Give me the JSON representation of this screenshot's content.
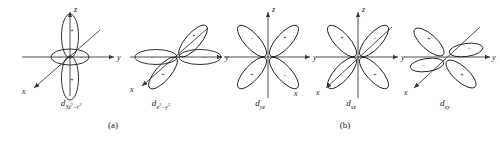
{
  "figure": {
    "background": "#ffffff",
    "stroke": "#1a1a1a",
    "axis_color": "#3a3a3a",
    "groups": [
      {
        "id": "a",
        "label": "(a)",
        "x": 113,
        "y": 124
      },
      {
        "id": "b",
        "label": "(b)",
        "x": 345,
        "y": 124
      }
    ],
    "axis_labels": {
      "x": "x",
      "y": "y",
      "z": "z"
    },
    "signs": {
      "positive": "+",
      "negative": "−"
    }
  },
  "orbitals": [
    {
      "name": "d-3z2-r2",
      "cx": 70,
      "cy": 57,
      "label_html": "d<sub>3z<sup>2</sup>−r<sup>2</sup></sub>",
      "label_text": "d3z2-r2",
      "label_x": 70,
      "label_y": 102,
      "type": "dz2",
      "lobes": [
        {
          "dir": "up",
          "sign": "+"
        },
        {
          "dir": "down",
          "sign": "+"
        },
        {
          "dir": "torus-left",
          "sign": "−"
        },
        {
          "dir": "torus-right",
          "sign": "−"
        }
      ]
    },
    {
      "name": "d-x2-y2",
      "cx": 178,
      "cy": 57,
      "label_html": "d<sub>x<sup>2</sup>−y<sup>2</sup></sub>",
      "label_text": "dx2-y2",
      "label_x": 160,
      "label_y": 102,
      "type": "dx2y2",
      "lobes": [
        {
          "dir": "+y",
          "sign": "−"
        },
        {
          "dir": "-y",
          "sign": "−"
        },
        {
          "dir": "+x",
          "sign": "+"
        },
        {
          "dir": "-x",
          "sign": "+"
        }
      ]
    },
    {
      "name": "d-yz",
      "cx": 268,
      "cy": 57,
      "label_html": "d<sub>yz</sub>",
      "label_text": "dyz",
      "label_x": 260,
      "label_y": 102,
      "type": "quad-upright",
      "lobes": [
        {
          "dir": "upper-left",
          "sign": "−"
        },
        {
          "dir": "upper-right",
          "sign": "+"
        },
        {
          "dir": "lower-left",
          "sign": "+"
        },
        {
          "dir": "lower-right",
          "sign": "−"
        }
      ]
    },
    {
      "name": "d-xz",
      "cx": 358,
      "cy": 57,
      "label_html": "d<sub>xz</sub>",
      "label_text": "dxz",
      "label_x": 351,
      "label_y": 102,
      "type": "quad-upright",
      "lobes": [
        {
          "dir": "upper-left",
          "sign": "+"
        },
        {
          "dir": "upper-right",
          "sign": "−"
        },
        {
          "dir": "lower-left",
          "sign": "−"
        },
        {
          "dir": "lower-right",
          "sign": "+"
        }
      ]
    },
    {
      "name": "d-xy",
      "cx": 446,
      "cy": 57,
      "label_html": "d<sub>xy</sub>",
      "label_text": "dxy",
      "label_x": 445,
      "label_y": 102,
      "type": "dxy",
      "lobes": [
        {
          "dir": "upper-left",
          "sign": "+"
        },
        {
          "dir": "upper-right",
          "sign": "−"
        },
        {
          "dir": "lower-left",
          "sign": "−"
        },
        {
          "dir": "lower-right",
          "sign": "+"
        }
      ]
    }
  ]
}
